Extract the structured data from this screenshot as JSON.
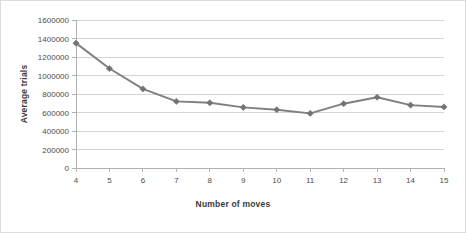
{
  "chart_data": {
    "type": "line",
    "title": "",
    "xlabel": "Number of moves",
    "ylabel": "Average trials",
    "categories": [
      4,
      5,
      6,
      7,
      8,
      9,
      10,
      11,
      12,
      13,
      14,
      15
    ],
    "x": [
      4,
      5,
      6,
      7,
      8,
      9,
      10,
      11,
      12,
      13,
      14,
      15
    ],
    "values": [
      1350000,
      1075000,
      855000,
      720000,
      705000,
      655000,
      630000,
      590000,
      695000,
      765000,
      680000,
      660000
    ],
    "series": [
      {
        "name": "Average trials",
        "values": [
          1350000,
          1075000,
          855000,
          720000,
          705000,
          655000,
          630000,
          590000,
          695000,
          765000,
          680000,
          660000
        ]
      }
    ],
    "xlim": [
      4,
      15
    ],
    "ylim": [
      0,
      1600000
    ],
    "ytick_values": [
      0,
      200000,
      400000,
      600000,
      800000,
      1000000,
      1200000,
      1400000,
      1600000
    ],
    "ytick_labels": [
      "0",
      "200000",
      "400000",
      "600000",
      "800000",
      "1000000",
      "1200000",
      "1400000",
      "1600000"
    ],
    "xtick_labels": [
      "4",
      "5",
      "6",
      "7",
      "8",
      "9",
      "10",
      "11",
      "12",
      "13",
      "14",
      "15"
    ],
    "grid": "horizontal",
    "legend": "none",
    "line_color": "#7f7f7f",
    "marker_color": "#737373",
    "marker_shape": "diamond",
    "gridline_color": "#d4d4d4",
    "axis_color": "#b0b0b0",
    "border_color": "#dcdcdc",
    "background_color": "#ffffff"
  }
}
